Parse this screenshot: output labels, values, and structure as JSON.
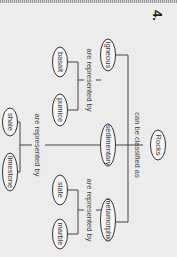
{
  "question_number": "4.",
  "concept_map": {
    "root": "Rocks",
    "root_link": "can be classified as",
    "categories": [
      {
        "name": "igneous",
        "link": "are represented by",
        "examples": [
          "basalt",
          "pumice"
        ]
      },
      {
        "name": "sedimentary",
        "link": "are represented by",
        "examples": [
          "shale",
          "limestone"
        ]
      },
      {
        "name": "metamorphic",
        "link": "are represented by",
        "examples": [
          "slate",
          "marble"
        ]
      }
    ]
  }
}
